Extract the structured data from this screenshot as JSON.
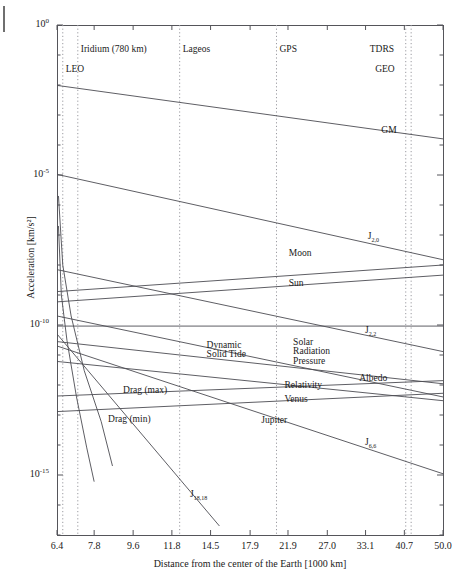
{
  "chart_data": {
    "type": "line",
    "title": "",
    "xlabel": "Distance from the center of the Earth [1000 km]",
    "ylabel": "Acceleration [km/s²]",
    "x_scale": "log",
    "y_scale": "log",
    "xlim": [
      6.4,
      50.0
    ],
    "ylim": [
      1e-17,
      1.0
    ],
    "grid": false,
    "legend": "inline-curve-labels",
    "xticks": [
      "6.4",
      "7.8",
      "9.6",
      "11.8",
      "14.5",
      "17.9",
      "21.9",
      "27.0",
      "33.1",
      "40.7",
      "50.0"
    ],
    "xtick_values": [
      6.4,
      7.8,
      9.6,
      11.8,
      14.5,
      17.9,
      21.9,
      27.0,
      33.1,
      40.7,
      50.0
    ],
    "yticks": [
      "10⁰",
      "10⁻⁵",
      "10⁻¹⁰",
      "10⁻¹⁵"
    ],
    "ytick_values": [
      1.0,
      1e-05,
      1e-10,
      1e-15
    ],
    "ytick_mantissa": [
      "10",
      "10",
      "10",
      "10"
    ],
    "ytick_exponent": [
      "0",
      "-5",
      "-10",
      "-15"
    ],
    "reference_lines": [
      {
        "name": "LEO",
        "label": "LEO",
        "x": 6.6,
        "label_row": 2
      },
      {
        "name": "Iridium (780 km)",
        "label": "Iridium (780 km)",
        "x": 7.15,
        "label_row": 1
      },
      {
        "name": "Lageos",
        "label": "Lageos",
        "x": 12.3,
        "label_row": 1
      },
      {
        "name": "GPS",
        "label": "GPS",
        "x": 20.6,
        "label_row": 1
      },
      {
        "name": "TDRS",
        "label": "TDRS",
        "x": 41.0,
        "label_row": 1
      },
      {
        "name": "GEO",
        "label": "GEO",
        "x": 42.2,
        "label_row": 2
      }
    ],
    "series": [
      {
        "name": "GM",
        "label": "GM",
        "points": [
          [
            6.4,
            0.0097
          ],
          [
            50.0,
            0.00016
          ]
        ],
        "label_x": 36.0,
        "label_y": 0.00027
      },
      {
        "name": "J2,0",
        "label": "J",
        "sub": "2,0",
        "points": [
          [
            6.4,
            1.05e-05
          ],
          [
            50.0,
            1.5e-08
          ]
        ],
        "label_x": 33.5,
        "label_y": 8e-08
      },
      {
        "name": "Moon",
        "label": "Moon",
        "points": [
          [
            6.4,
            1.3e-09
          ],
          [
            50.0,
            1e-08
          ]
        ],
        "label_x": 22.0,
        "label_y": 2.2e-08
      },
      {
        "name": "Sun",
        "label": "Sun",
        "points": [
          [
            6.4,
            5.9e-10
          ],
          [
            50.0,
            4.6e-09
          ]
        ],
        "label_x": 22.0,
        "label_y": 2.1e-09
      },
      {
        "name": "J2,2",
        "label": "J",
        "sub": "2,2",
        "points": [
          [
            6.4,
            7e-09
          ],
          [
            50.0,
            1.3e-11
          ]
        ],
        "label_x": 33.0,
        "label_y": 6e-11
      },
      {
        "name": "Solar Radiation Pressure",
        "label": "Solar\nRadiation\nPressure",
        "points": [
          [
            6.4,
            9.2e-11
          ],
          [
            50.0,
            9.2e-11
          ]
        ],
        "label_x": 22.5,
        "label_y": 2.4e-11
      },
      {
        "name": "Dynamic Solid Tide",
        "label": "Dynamic\nSolid Tide",
        "points": [
          [
            6.4,
            2e-10
          ],
          [
            50.0,
            4e-13
          ]
        ],
        "label_x": 14.2,
        "label_y": 1.9e-11
      },
      {
        "name": "Albedo",
        "label": "Albedo",
        "points": [
          [
            6.4,
            2.8e-11
          ],
          [
            50.0,
            1.1e-12
          ]
        ],
        "label_x": 32.0,
        "label_y": 1.5e-12
      },
      {
        "name": "Relativity",
        "label": "Relativity",
        "points": [
          [
            6.4,
            6.1e-12
          ],
          [
            50.0,
            3e-13
          ]
        ],
        "label_x": 21.5,
        "label_y": 8.5e-13
      },
      {
        "name": "Venus",
        "label": "Venus",
        "points": [
          [
            6.4,
            4.3e-13
          ],
          [
            50.0,
            1.4e-12
          ]
        ],
        "label_x": 21.5,
        "label_y": 3e-13
      },
      {
        "name": "Jupiter",
        "label": "Jupiter",
        "points": [
          [
            6.4,
            1.3e-13
          ],
          [
            50.0,
            5.3e-13
          ]
        ],
        "label_x": 19.0,
        "label_y": 6e-14
      },
      {
        "name": "J6,6",
        "label": "J",
        "sub": "6,6",
        "points": [
          [
            6.4,
            2e-11
          ],
          [
            50.0,
            1.1e-15
          ]
        ],
        "label_x": 33.0,
        "label_y": 1.1e-14
      },
      {
        "name": "J18,18",
        "label": "J",
        "sub": "18,18",
        "points": [
          [
            6.4,
            5e-11
          ],
          [
            15.2,
            2e-17
          ]
        ],
        "label_x": 13.0,
        "label_y": 2e-16
      },
      {
        "name": "Drag (max)",
        "label": "Drag (max)",
        "points": [
          [
            6.45,
            2e-06
          ],
          [
            6.6,
            1e-08
          ],
          [
            6.9,
            2e-10
          ],
          [
            7.4,
            3e-12
          ],
          [
            8.1,
            6e-14
          ],
          [
            8.6,
            2e-15
          ]
        ],
        "label_x": 9.1,
        "label_y": 6e-13
      },
      {
        "name": "Drag (min)",
        "label": "Drag (min)",
        "points": [
          [
            6.45,
            2e-07
          ],
          [
            6.55,
            1e-09
          ],
          [
            6.75,
            3e-11
          ],
          [
            7.1,
            4e-13
          ],
          [
            7.5,
            8e-15
          ],
          [
            7.8,
            6e-16
          ]
        ],
        "label_x": 8.4,
        "label_y": 6.5e-14
      }
    ]
  },
  "figure": {
    "plot_left": 57,
    "plot_right": 443,
    "plot_top": 25,
    "plot_bottom": 535
  }
}
